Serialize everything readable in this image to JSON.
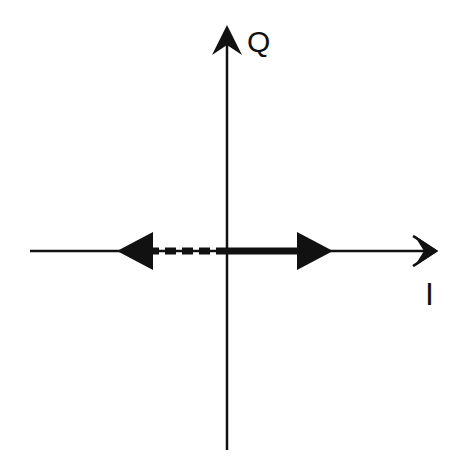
{
  "diagram": {
    "type": "iq-constellation",
    "axes": {
      "vertical_label": "Q",
      "horizontal_label": "I"
    },
    "vectors": [
      {
        "name": "positive-I-vector",
        "direction": "right",
        "style": "solid"
      },
      {
        "name": "negative-I-vector",
        "direction": "left",
        "style": "dashed"
      }
    ],
    "colors": {
      "line": "#111111",
      "background": "#ffffff"
    }
  }
}
